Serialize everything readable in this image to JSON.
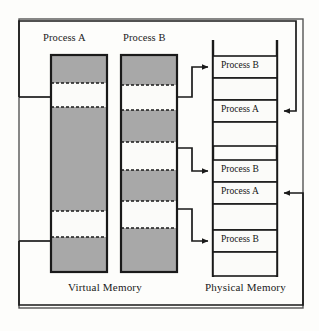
{
  "figure": {
    "type": "diagram",
    "colors": {
      "page_background": "#fdfdfb",
      "outline": "#1a1a1a",
      "allocated_fill": "#a8a8a8",
      "free_fill": "#fbfbf9",
      "connector": "#1a1a1a",
      "frame_box_fill": "#fbfbf9"
    }
  },
  "outer_border": {
    "name": "diagram-outer-border",
    "x": 18,
    "y": 18,
    "width": 285,
    "height": 291
  },
  "columns": {
    "process_a": {
      "title": "Process A",
      "title_x": 43,
      "title_y": 38,
      "box": {
        "x": 51,
        "y": 55,
        "width": 56,
        "height": 217
      },
      "segments": [
        {
          "label": "allocated",
          "state": "allocated",
          "height": 28
        },
        {
          "label": "free",
          "state": "free",
          "height": 24
        },
        {
          "label": "allocated",
          "state": "allocated",
          "height": 104
        },
        {
          "label": "free",
          "state": "free",
          "height": 26
        },
        {
          "label": "allocated",
          "state": "allocated",
          "height": 35
        }
      ]
    },
    "process_b": {
      "title": "Process B",
      "title_x": 123,
      "title_y": 38,
      "box": {
        "x": 121,
        "y": 55,
        "width": 56,
        "height": 217
      },
      "segments": [
        {
          "label": "allocated",
          "state": "allocated",
          "height": 30
        },
        {
          "label": "free",
          "state": "free",
          "height": 25
        },
        {
          "label": "allocated",
          "state": "allocated",
          "height": 32
        },
        {
          "label": "free",
          "state": "free",
          "height": 28
        },
        {
          "label": "allocated",
          "state": "allocated",
          "height": 31
        },
        {
          "label": "free",
          "state": "free",
          "height": 27
        },
        {
          "label": "allocated",
          "state": "allocated",
          "height": 44
        }
      ]
    }
  },
  "physical_memory": {
    "rail_left_x": 213,
    "rail_right_x": 277,
    "rail_top_y": 40,
    "rail_bottom_y": 277,
    "frames": [
      {
        "label": "Process B",
        "owner": "B",
        "occupied": true,
        "y": 56,
        "height": 22
      },
      {
        "label": "",
        "owner": "",
        "occupied": false,
        "y": 78,
        "height": 22
      },
      {
        "label": "Process A",
        "owner": "A",
        "occupied": true,
        "y": 100,
        "height": 22
      },
      {
        "label": "",
        "owner": "",
        "occupied": false,
        "y": 122,
        "height": 24
      },
      {
        "label": "Process B",
        "owner": "B",
        "occupied": true,
        "y": 160,
        "height": 22
      },
      {
        "label": "Process A",
        "owner": "A",
        "occupied": true,
        "y": 182,
        "height": 22
      },
      {
        "label": "",
        "owner": "",
        "occupied": false,
        "y": 204,
        "height": 26
      },
      {
        "label": "Process B",
        "owner": "B",
        "occupied": true,
        "y": 230,
        "height": 22
      },
      {
        "label": "",
        "owner": "",
        "occupied": false,
        "y": 252,
        "height": 24
      }
    ]
  },
  "footers": {
    "virtual": {
      "text": "Virtual Memory",
      "x": 68,
      "y": 286
    },
    "physical": {
      "text": "Physical Memory",
      "x": 205,
      "y": 286
    }
  },
  "connectors": {
    "process_b_to_physical": [
      {
        "name": "b-page-1-to-frame-1",
        "from_x": 177,
        "from_y": 97,
        "mid_x": 192,
        "to_x": 211,
        "to_y": 67
      },
      {
        "name": "b-page-2-to-frame-5",
        "from_x": 177,
        "from_y": 148,
        "mid_x": 192,
        "to_x": 211,
        "to_y": 171
      },
      {
        "name": "b-page-3-to-frame-8",
        "from_x": 177,
        "from_y": 209,
        "mid_x": 192,
        "to_x": 211,
        "to_y": 241
      }
    ],
    "physical_to_process_a": [
      {
        "name": "frame-3-to-a-page-1",
        "arrow_x": 279,
        "arrow_y": 111,
        "right_x": 296,
        "top_y": 21,
        "left_x": 19,
        "down_y": 97,
        "into_x": 49
      },
      {
        "name": "frame-6-to-a-page-2",
        "arrow_x": 279,
        "arrow_y": 193,
        "right_x": 303,
        "bottom_y": 305,
        "left_x": 19,
        "up_y": 241,
        "into_x": 49
      }
    ]
  }
}
